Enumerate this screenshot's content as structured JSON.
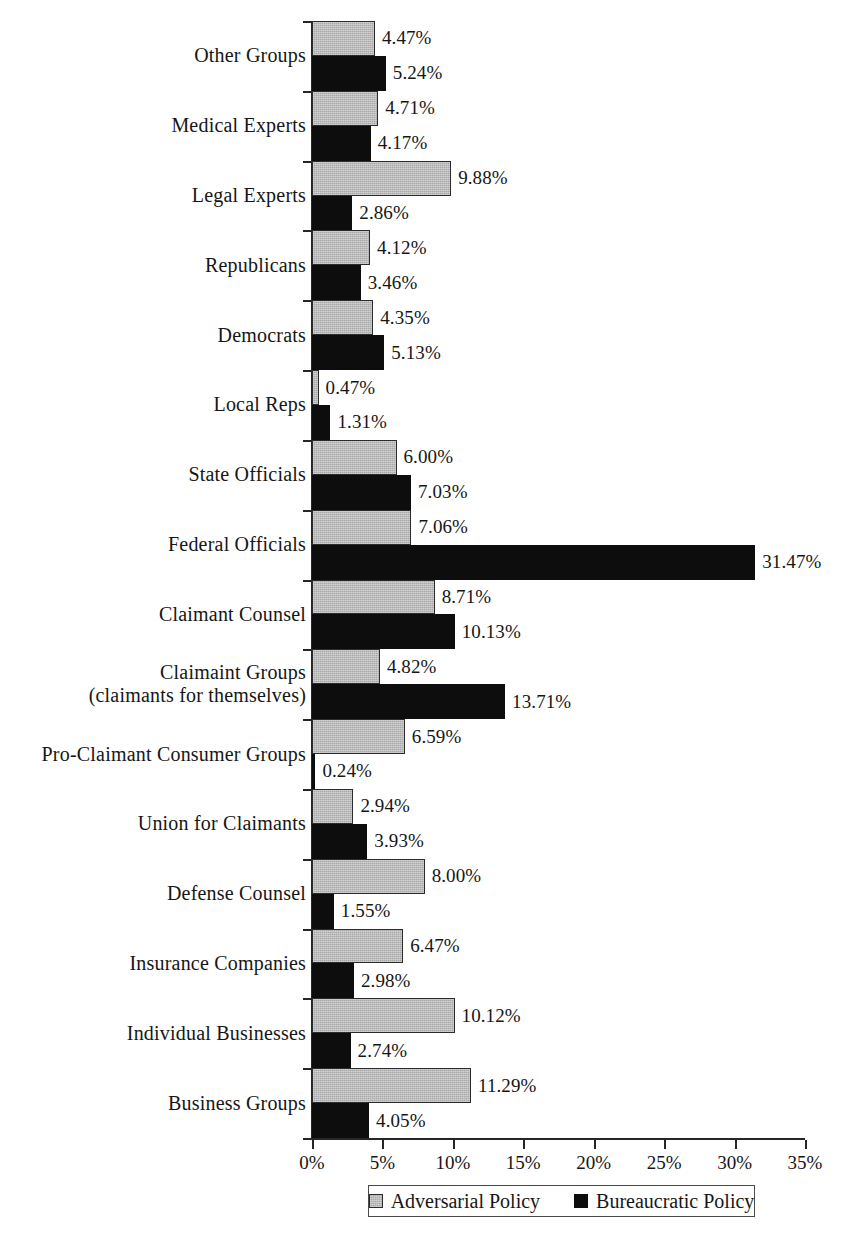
{
  "chart_data": {
    "type": "bar",
    "orientation": "horizontal",
    "title": "",
    "subtitle": "",
    "xlabel": "",
    "ylabel": "",
    "xlim": [
      0,
      35
    ],
    "xticks": [
      "0%",
      "5%",
      "10%",
      "15%",
      "20%",
      "25%",
      "30%",
      "35%"
    ],
    "xtick_values": [
      0,
      5,
      10,
      15,
      20,
      25,
      30,
      35
    ],
    "grid": false,
    "legend_position": "bottom",
    "value_format": "percent-2dp",
    "categories": [
      "Other  Groups",
      "Medical Experts",
      "Legal Experts",
      "Republicans",
      "Democrats",
      "Local Reps",
      "State Officials",
      "Federal Officials",
      "Claimant Counsel",
      "Claimaint Groups\n(claimants  for themselves)",
      "Pro-Claimant Consumer Groups",
      "Union for Claimants",
      "Defense Counsel",
      "Insurance Companies",
      "Individual Businesses",
      "Business Groups"
    ],
    "series": [
      {
        "name": "Adversarial Policy",
        "color": "#a9a9a9",
        "values": [
          4.47,
          4.71,
          9.88,
          4.12,
          4.35,
          0.47,
          6.0,
          7.06,
          8.71,
          4.82,
          6.59,
          2.94,
          8.0,
          6.47,
          10.12,
          11.29
        ],
        "labels": [
          "4.47%",
          "4.71%",
          "9.88%",
          "4.12%",
          "4.35%",
          "0.47%",
          "6.00%",
          "7.06%",
          "8.71%",
          "4.82%",
          "6.59%",
          "2.94%",
          "8.00%",
          "6.47%",
          "10.12%",
          "11.29%"
        ]
      },
      {
        "name": "Bureaucratic Policy",
        "color": "#0d0d0d",
        "values": [
          5.24,
          4.17,
          2.86,
          3.46,
          5.13,
          1.31,
          7.03,
          31.47,
          10.13,
          13.71,
          0.24,
          3.93,
          1.55,
          2.98,
          2.74,
          4.05
        ],
        "labels": [
          "5.24%",
          "4.17%",
          "2.86%",
          "3.46%",
          "5.13%",
          "1.31%",
          "7.03%",
          "31.47%",
          "10.13%",
          "13.71%",
          "0.24%",
          "3.93%",
          "1.55%",
          "2.98%",
          "2.74%",
          "4.05%"
        ]
      }
    ]
  },
  "legend": {
    "entries": [
      {
        "label": "Adversarial Policy",
        "swatch": "adversarial"
      },
      {
        "label": "Bureaucratic Policy",
        "swatch": "bureaucratic"
      }
    ]
  }
}
